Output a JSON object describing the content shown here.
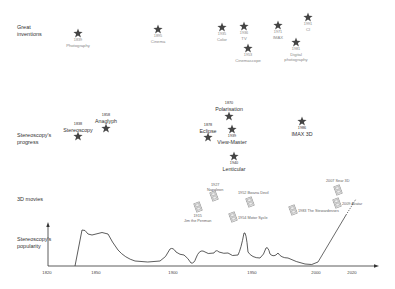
{
  "rows": {
    "inventions": "Great\ninventions",
    "progress": "Stereoscopy's\nprogress",
    "movies": "3D movies",
    "popularity": "Stereoscopy's\npopularity"
  },
  "inventions": [
    {
      "year": "1839",
      "name": "Photography",
      "x": 78,
      "y": 33
    },
    {
      "year": "1895",
      "name": "Cinema",
      "x": 158,
      "y": 29
    },
    {
      "year": "1935",
      "name": "Color",
      "x": 222,
      "y": 27
    },
    {
      "year": "1936",
      "name": "TV",
      "x": 244,
      "y": 26
    },
    {
      "year": "1953",
      "name": "Cinemascope",
      "x": 248,
      "y": 48
    },
    {
      "year": "1971",
      "name": "IMAX",
      "x": 278,
      "y": 25
    },
    {
      "year": "1981",
      "name": "Digital\nphotography",
      "x": 296,
      "y": 42
    },
    {
      "year": "1991",
      "name": "CI",
      "x": 308,
      "y": 17
    }
  ],
  "progress": [
    {
      "year": "1838",
      "name": "Stereoscopy",
      "x": 78,
      "y": 136
    },
    {
      "year": "1858",
      "name": "Anaglyph",
      "x": 106,
      "y": 128
    },
    {
      "year": "1870",
      "name": "Polarisation",
      "x": 229,
      "y": 116
    },
    {
      "year": "1878",
      "name": "Eclipse",
      "x": 208,
      "y": 137
    },
    {
      "year": "1939",
      "name": "View-Master",
      "x": 232,
      "y": 129
    },
    {
      "year": "1940",
      "name": "Lenticular",
      "x": 234,
      "y": 156
    },
    {
      "year": "1986",
      "name": "IMAX 3D",
      "x": 302,
      "y": 121
    }
  ],
  "movies": [
    {
      "year": "1915",
      "name": "Jim the Penman",
      "x": 198,
      "y": 207
    },
    {
      "year": "1927",
      "name": "Napoleon",
      "x": 214,
      "y": 196
    },
    {
      "year": "1952",
      "name": "Bwana Devil",
      "x": 250,
      "y": 202
    },
    {
      "year": "1954",
      "name": "Motor Sycle",
      "x": 233,
      "y": 217
    },
    {
      "year": "1983",
      "name": "The Stewardesses",
      "x": 293,
      "y": 210
    },
    {
      "year": "2007",
      "name": "Sear 3D",
      "x": 338,
      "y": 190
    },
    {
      "year": "2009",
      "name": "Avatar",
      "x": 337,
      "y": 203
    }
  ],
  "axis": {
    "ticks": [
      {
        "label": "1820",
        "x": 47
      },
      {
        "label": "1850",
        "x": 96
      },
      {
        "label": "1900",
        "x": 173
      },
      {
        "label": "1950",
        "x": 252
      },
      {
        "label": "2000",
        "x": 316
      },
      {
        "label": "2020",
        "x": 352
      }
    ]
  },
  "colors": {
    "star": "#444444",
    "curve": "#333333",
    "film": "#888888"
  }
}
